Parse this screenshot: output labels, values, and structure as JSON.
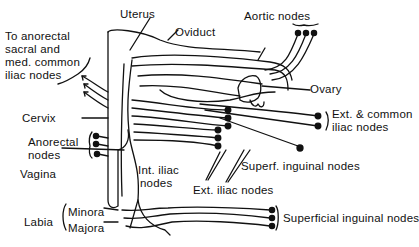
{
  "diagram": {
    "background": "#ffffff",
    "ink": "#111111",
    "labels": {
      "uterus": "Uterus",
      "oviduct": "Oviduct",
      "aortic_nodes": "Aortic nodes",
      "to_anorectal_line1": "To anorectal",
      "to_anorectal_line2": "sacral and",
      "to_anorectal_line3": "med. common",
      "to_anorectal_line4": "iliac nodes",
      "ovary": "Ovary",
      "cervix": "Cervix",
      "ext_common_line1": "Ext. & common",
      "ext_common_line2": "iliac nodes",
      "anorectal_line1": "Anorectal",
      "anorectal_line2": "nodes",
      "vagina": "Vagina",
      "int_iliac_line1": "Int. iliac",
      "int_iliac_line2": "nodes",
      "superf_inguinal": "Superf. inguinal nodes",
      "ext_iliac": "Ext. iliac nodes",
      "labia": "Labia",
      "minora": "Minora",
      "majora": "Majora",
      "superficial_inguinal": "Superficial inguinal nodes"
    }
  }
}
